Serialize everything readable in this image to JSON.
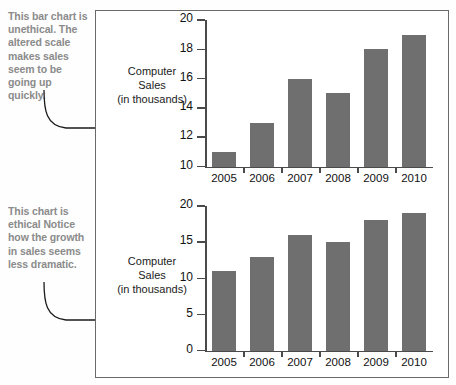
{
  "annotations": {
    "top": "This bar chart is unethical. The altered scale makes sales seem to be going up quickly.",
    "bottom": "This chart is ethical Notice how the growth in sales seems less dramatic."
  },
  "colors": {
    "bar": "#6f6f6f",
    "axis": "#4a4a4a",
    "annotation_text": "#8b8b8b",
    "frame": "#6a6a6a"
  },
  "chart_data": [
    {
      "type": "bar",
      "title": "",
      "xlabel": "",
      "ylabel": "Computer Sales (in thousands)",
      "ylabel_line1": "Computer",
      "ylabel_line2": "Sales",
      "ylabel_line3": "(in thousands)",
      "categories": [
        "2005",
        "2006",
        "2007",
        "2008",
        "2009",
        "2010"
      ],
      "values": [
        11,
        13,
        16,
        15,
        18,
        19
      ],
      "ylim": [
        10,
        20
      ],
      "yticks": [
        10,
        12,
        14,
        16,
        18,
        20
      ],
      "grid": false,
      "legend": false
    },
    {
      "type": "bar",
      "title": "",
      "xlabel": "",
      "ylabel": "Computer Sales (in thousands)",
      "ylabel_line1": "Computer",
      "ylabel_line2": "Sales",
      "ylabel_line3": "(in thousands)",
      "categories": [
        "2005",
        "2006",
        "2007",
        "2008",
        "2009",
        "2010"
      ],
      "values": [
        11,
        13,
        16,
        15,
        18,
        19
      ],
      "ylim": [
        0,
        20
      ],
      "yticks": [
        0,
        5,
        10,
        15,
        20
      ],
      "grid": false,
      "legend": false
    }
  ]
}
